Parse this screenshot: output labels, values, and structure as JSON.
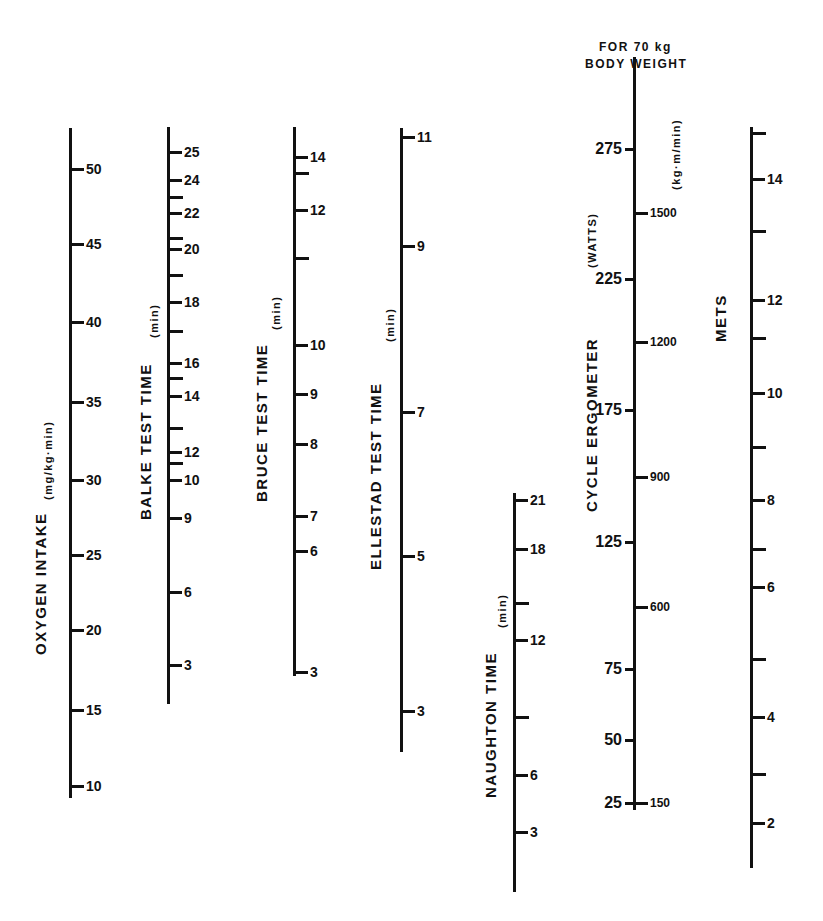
{
  "chart_data": {
    "type": "nomogram",
    "title": "",
    "axes": [
      {
        "id": "oxygen",
        "title": "OXYGEN INTAKE",
        "unit": "(mg/kg·min)",
        "x": 69,
        "top": 128,
        "bottom": 798,
        "tick_side": "right",
        "title_x": 32,
        "title_y": 655,
        "unit_x": 42,
        "unit_y": 500,
        "ticks": [
          {
            "y": 169,
            "label": "50"
          },
          {
            "y": 244,
            "label": "45"
          },
          {
            "y": 322,
            "label": "40"
          },
          {
            "y": 402,
            "label": "35"
          },
          {
            "y": 480,
            "label": "30"
          },
          {
            "y": 555,
            "label": "25"
          },
          {
            "y": 630,
            "label": "20"
          },
          {
            "y": 710,
            "label": "15"
          },
          {
            "y": 786,
            "label": "10"
          }
        ]
      },
      {
        "id": "balke",
        "title": "BALKE TEST TIME",
        "unit": "(min)",
        "x": 167,
        "top": 127,
        "bottom": 704,
        "tick_side": "right",
        "title_x": 137,
        "title_y": 520,
        "unit_x": 148,
        "unit_y": 338,
        "ticks": [
          {
            "y": 152,
            "label": "25"
          },
          {
            "y": 180,
            "label": "24"
          },
          {
            "y": 197,
            "label": ""
          },
          {
            "y": 213,
            "label": "22"
          },
          {
            "y": 238,
            "label": ""
          },
          {
            "y": 249,
            "label": "20"
          },
          {
            "y": 275,
            "label": ""
          },
          {
            "y": 302,
            "label": "18"
          },
          {
            "y": 331,
            "label": ""
          },
          {
            "y": 363,
            "label": "16"
          },
          {
            "y": 378,
            "label": ""
          },
          {
            "y": 396,
            "label": "14"
          },
          {
            "y": 428,
            "label": ""
          },
          {
            "y": 452,
            "label": "12"
          },
          {
            "y": 463,
            "label": ""
          },
          {
            "y": 480,
            "label": "10"
          },
          {
            "y": 518,
            "label": "9"
          },
          {
            "y": 592,
            "label": "6"
          },
          {
            "y": 665,
            "label": "3"
          }
        ]
      },
      {
        "id": "bruce",
        "title": "BRUCE TEST TIME",
        "unit": "(min)",
        "x": 293,
        "top": 127,
        "bottom": 676,
        "tick_side": "right",
        "title_x": 253,
        "title_y": 502,
        "unit_x": 270,
        "unit_y": 330,
        "ticks": [
          {
            "y": 157,
            "label": "14"
          },
          {
            "y": 173,
            "label": ""
          },
          {
            "y": 210,
            "label": "12"
          },
          {
            "y": 258,
            "label": ""
          },
          {
            "y": 345,
            "label": "10"
          },
          {
            "y": 394,
            "label": "9"
          },
          {
            "y": 444,
            "label": "8"
          },
          {
            "y": 516,
            "label": "7"
          },
          {
            "y": 551,
            "label": "6"
          },
          {
            "y": 672,
            "label": "3"
          }
        ]
      },
      {
        "id": "ellestad",
        "title": "ELLESTAD  TEST TIME",
        "unit": "(min)",
        "x": 400,
        "top": 128,
        "bottom": 752,
        "tick_side": "right",
        "title_x": 367,
        "title_y": 570,
        "unit_x": 384,
        "unit_y": 342,
        "ticks": [
          {
            "y": 137,
            "label": "11"
          },
          {
            "y": 246,
            "label": "9"
          },
          {
            "y": 412,
            "label": "7"
          },
          {
            "y": 556,
            "label": "5"
          },
          {
            "y": 711,
            "label": "3"
          }
        ]
      },
      {
        "id": "naughton",
        "title": "NAUGHTON TIME",
        "unit": "(min)",
        "x": 513,
        "top": 493,
        "bottom": 892,
        "tick_side": "right",
        "title_x": 482,
        "title_y": 798,
        "unit_x": 496,
        "unit_y": 628,
        "ticks": [
          {
            "y": 500,
            "label": "21"
          },
          {
            "y": 549,
            "label": "18"
          },
          {
            "y": 603,
            "label": ""
          },
          {
            "y": 640,
            "label": "12"
          },
          {
            "y": 717,
            "label": ""
          },
          {
            "y": 775,
            "label": "6"
          },
          {
            "y": 832,
            "label": "3"
          }
        ]
      },
      {
        "id": "cycle",
        "title": "CYCLE ERGOMETER",
        "unit_left": "(WATTS)",
        "unit_right": "(kg·m/min)",
        "header_line1": "FOR   70 kg",
        "header_line2": "BODY   WEIGHT",
        "x": 633,
        "top": 57,
        "bottom": 810,
        "tick_side": "both",
        "title_x": 583,
        "title_y": 512,
        "unit_left_x": 586,
        "unit_left_y": 268,
        "unit_right_x": 670,
        "unit_right_y": 190,
        "ticks_left": [
          {
            "y": 149,
            "label": "275"
          },
          {
            "y": 279,
            "label": "225"
          },
          {
            "y": 410,
            "label": "175"
          },
          {
            "y": 542,
            "label": "125"
          },
          {
            "y": 669,
            "label": "75"
          },
          {
            "y": 740,
            "label": "50"
          },
          {
            "y": 803,
            "label": "25"
          }
        ],
        "ticks_right": [
          {
            "y": 213,
            "label": "1500"
          },
          {
            "y": 342,
            "label": "1200"
          },
          {
            "y": 477,
            "label": "900"
          },
          {
            "y": 607,
            "label": "600"
          },
          {
            "y": 803,
            "label": "150"
          }
        ]
      },
      {
        "id": "mets",
        "title": "METS",
        "unit": "",
        "x": 750,
        "top": 127,
        "bottom": 868,
        "tick_side": "right",
        "title_x": 712,
        "title_y": 342,
        "ticks": [
          {
            "y": 133,
            "label": ""
          },
          {
            "y": 179,
            "label": "14"
          },
          {
            "y": 231,
            "label": ""
          },
          {
            "y": 300,
            "label": "12"
          },
          {
            "y": 338,
            "label": ""
          },
          {
            "y": 393,
            "label": "10"
          },
          {
            "y": 447,
            "label": ""
          },
          {
            "y": 500,
            "label": "8"
          },
          {
            "y": 549,
            "label": ""
          },
          {
            "y": 587,
            "label": "6"
          },
          {
            "y": 659,
            "label": ""
          },
          {
            "y": 717,
            "label": "4"
          },
          {
            "y": 774,
            "label": ""
          },
          {
            "y": 823,
            "label": "2"
          }
        ]
      }
    ]
  }
}
